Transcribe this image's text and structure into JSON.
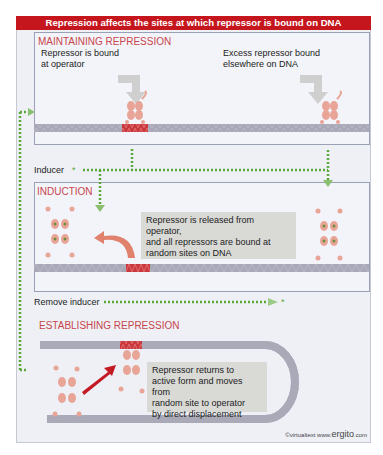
{
  "title": "Repression affects the sites at which repressor is bound on DNA",
  "sections": {
    "maintaining": {
      "title": "MAINTAINING REPRESSION",
      "label_left": [
        "Repressor is bound",
        "at operator"
      ],
      "label_right": [
        "Excess repressor bound",
        "elsewhere on DNA"
      ]
    },
    "inducer_label": "Inducer",
    "induction": {
      "title": "INDUCTION",
      "callout": [
        "Repressor is released from operator,",
        "and all repressors are bound at",
        "random sites on DNA"
      ]
    },
    "remove_inducer_label": "Remove inducer",
    "establishing": {
      "title": "ESTABLISHING REPRESSION",
      "callout": [
        "Repressor returns to",
        "active form and moves from",
        "random site to operator",
        "by direct displacement"
      ]
    }
  },
  "copyright": {
    "prefix": "©virtualtext  www.",
    "brand": "ergito",
    "suffix": ".com"
  },
  "colors": {
    "title_bar": "#c4161c",
    "section_title": "#c8454d",
    "repressor": "#e8a597",
    "operator": "#c9383d",
    "dna": "#a9a8b8",
    "inducer_path": "#5aa83a",
    "arrow_red": "#c41a24"
  }
}
